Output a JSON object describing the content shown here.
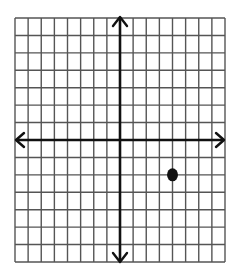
{
  "graph": {
    "type": "coordinate-plane",
    "columns": 16,
    "rows": 14,
    "x_range": [
      -8,
      8
    ],
    "y_range": [
      -7,
      7
    ],
    "origin_col": 8,
    "origin_row": 7,
    "grid_color": "#555555",
    "axis_color": "#111111",
    "points": [
      {
        "x": 4,
        "y": -2,
        "label": ""
      }
    ]
  }
}
